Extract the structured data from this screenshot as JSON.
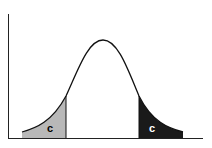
{
  "diagram": {
    "type": "normal-distribution-two-tailed",
    "left_tail": {
      "label": "c",
      "fill": "#b8b8b8",
      "label_color": "#000000"
    },
    "right_tail": {
      "label": "c",
      "fill": "#1a1a1a",
      "label_color": "#ffffff"
    },
    "curve_color": "#111111",
    "axis_color": "#222222"
  }
}
